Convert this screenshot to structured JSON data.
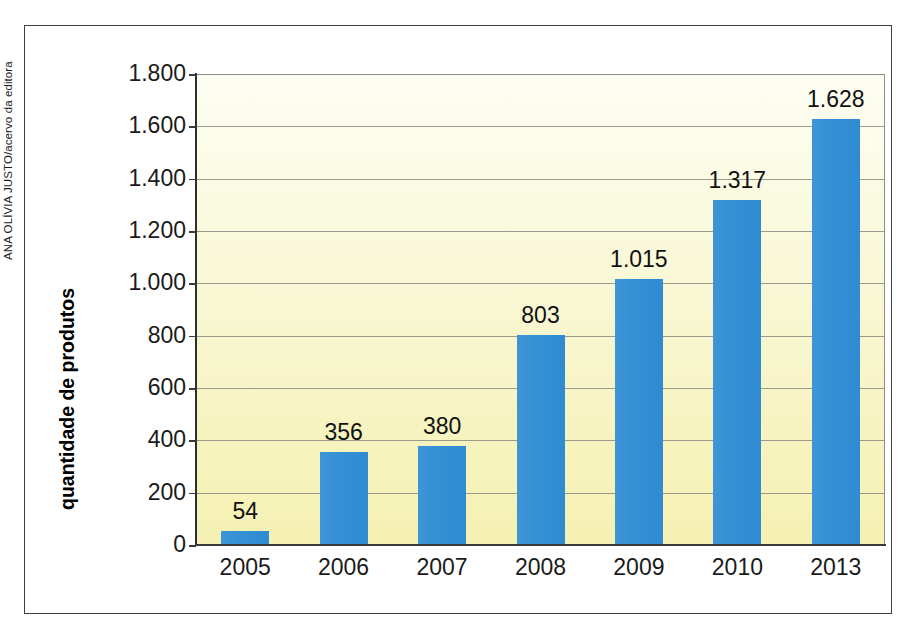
{
  "credit": "ANA OLÍVIA JUSTO/acervo da editora",
  "axis": {
    "y_title": "quantidade de produtos"
  },
  "colors": {
    "bar": "#3590d4",
    "plot_background_top": "#fdfdf3",
    "plot_background_bottom": "#f5f1b4",
    "gridline": "#8a8a82",
    "axis": "#2e2e2e",
    "frame": "#3f3f3f",
    "text": "#1a1a1a"
  },
  "chart_data": {
    "type": "bar",
    "title": "",
    "xlabel": "",
    "ylabel": "quantidade de produtos",
    "categories": [
      "2005",
      "2006",
      "2007",
      "2008",
      "2009",
      "2010",
      "2013"
    ],
    "values": [
      54,
      356,
      380,
      803,
      1015,
      1317,
      1628
    ],
    "value_labels": [
      "54",
      "356",
      "380",
      "803",
      "1.015",
      "1.317",
      "1.628"
    ],
    "ylim": [
      0,
      1800
    ],
    "yticks": [
      0,
      200,
      400,
      600,
      800,
      1000,
      1200,
      1400,
      1600,
      1800
    ],
    "ytick_labels": [
      "0",
      "200",
      "400",
      "600",
      "800",
      "1.000",
      "1.200",
      "1.400",
      "1.600",
      "1.800"
    ],
    "grid": true,
    "legend": null,
    "series": [
      {
        "name": "quantidade de produtos",
        "values": [
          54,
          356,
          380,
          803,
          1015,
          1317,
          1628
        ]
      }
    ]
  }
}
